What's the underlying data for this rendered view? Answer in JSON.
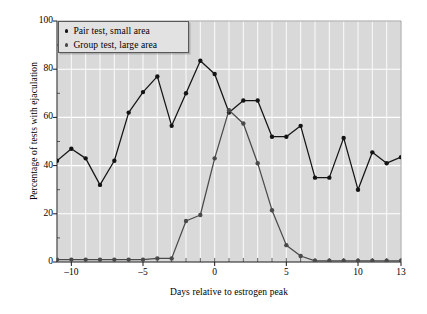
{
  "chart_data": {
    "type": "line",
    "title": "",
    "xlabel": "Days relative to estrogen peak",
    "ylabel": "Percentage of tests with ejaculation",
    "xlim": [
      -11,
      13
    ],
    "ylim": [
      0,
      100
    ],
    "grid": true,
    "grid_color": "#ffffff",
    "plot_background": "#d9d9d9",
    "legend_position": "top-left",
    "x": [
      -11,
      -10,
      -9,
      -8,
      -7,
      -6,
      -5,
      -4,
      -3,
      -2,
      -1,
      0,
      1,
      2,
      3,
      4,
      5,
      6,
      7,
      8,
      9,
      10,
      11,
      12,
      13
    ],
    "xticks": [
      -10,
      -5,
      0,
      5,
      10,
      13
    ],
    "xtick_labels": [
      "–10",
      "–5",
      "0",
      "5",
      "10",
      "13"
    ],
    "yticks": [
      0,
      20,
      40,
      60,
      80,
      100
    ],
    "ytick_labels": [
      "0",
      "20",
      "40",
      "60",
      "80",
      "100"
    ],
    "series": [
      {
        "name": "Pair test, small area",
        "color": "#141414",
        "marker": "circle",
        "values": [
          42,
          47,
          43,
          32,
          42,
          62,
          70.5,
          77,
          56.5,
          70,
          83.5,
          78,
          62,
          67,
          67,
          52,
          52,
          56.5,
          35,
          35,
          51.5,
          30,
          45.5,
          41,
          43.5
        ]
      },
      {
        "name": "Group test, large area",
        "color": "#4a4a4a",
        "marker": "circle",
        "values": [
          1,
          1,
          1,
          1,
          1,
          1,
          1,
          1.5,
          1.5,
          17,
          19.5,
          43,
          63,
          57.5,
          41,
          21.5,
          7,
          2.5,
          0.5,
          0.5,
          0.5,
          0.5,
          0.5,
          0.5,
          0.5
        ]
      }
    ]
  },
  "legend": {
    "items": [
      {
        "label": "Pair test, small area",
        "color": "#141414"
      },
      {
        "label": "Group test, large area",
        "color": "#4a4a4a"
      }
    ]
  },
  "axes": {
    "x_title": "Days relative to estrogen peak",
    "y_title": "Percentage of tests with ejaculation"
  }
}
